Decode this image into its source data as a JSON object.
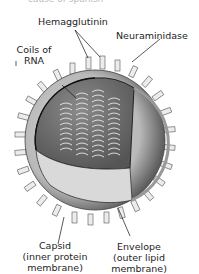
{
  "figure": {
    "title_cut": "cause of spanish",
    "labels": {
      "hemagglutinin": "Hemagglutinin",
      "neuraminidase": "Neuraminidase",
      "coils_line1": "Coils of",
      "coils_line2": "RNA",
      "capsid_line1": "Capsid",
      "capsid_line2": "(inner protein",
      "capsid_line3": "membrane)",
      "envelope_line1": "Envelope",
      "envelope_line2": "(outer lipid",
      "envelope_line3": "membrane)"
    },
    "colors": {
      "envelope": "#c4c4c4",
      "interior": "#6e6e6e",
      "capsid_lower": "#d8d8d8",
      "shadow": "#5a5a5a",
      "spike": "#e9e9e9"
    }
  }
}
